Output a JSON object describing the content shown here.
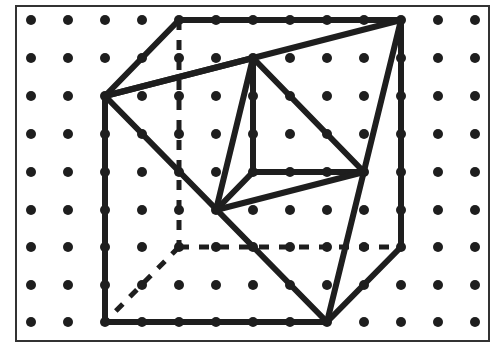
{
  "figure": {
    "colors": {
      "background": "#ffffff",
      "ink": "#1e1e1e",
      "frame": "#333333"
    },
    "frame": {
      "x": 16,
      "y": 6,
      "width": 473,
      "height": 335
    },
    "grid": {
      "columns_x": [
        31,
        68,
        105,
        142,
        179,
        216,
        253,
        290,
        327,
        364,
        401,
        438,
        475
      ],
      "rows_y": [
        20,
        58,
        96,
        134,
        172,
        210,
        247,
        285,
        322
      ],
      "dot_radius": 5
    },
    "vertices": {
      "A": [
        4,
        0
      ],
      "B": [
        10,
        0
      ],
      "C": [
        2,
        2
      ],
      "D": [
        6,
        1
      ],
      "E": [
        6,
        4
      ],
      "F": [
        9,
        4
      ],
      "G": [
        5,
        5
      ],
      "H": [
        10,
        6
      ],
      "I": [
        2,
        8
      ],
      "J": [
        8,
        8
      ],
      "K": [
        4,
        6
      ]
    },
    "solid_edges": [
      [
        "A",
        "B"
      ],
      [
        "A",
        "C"
      ],
      [
        "C",
        "B"
      ],
      [
        "C",
        "I"
      ],
      [
        "I",
        "J"
      ],
      [
        "B",
        "H"
      ],
      [
        "H",
        "J"
      ],
      [
        "C",
        "J"
      ],
      [
        "B",
        "J"
      ],
      [
        "D",
        "C"
      ],
      [
        "D",
        "E"
      ],
      [
        "D",
        "F"
      ],
      [
        "D",
        "G"
      ],
      [
        "E",
        "F"
      ],
      [
        "E",
        "G"
      ],
      [
        "G",
        "F"
      ]
    ],
    "dashed_edges": [
      [
        "A",
        "K"
      ],
      [
        "K",
        "H"
      ],
      [
        "K",
        "I"
      ]
    ]
  }
}
